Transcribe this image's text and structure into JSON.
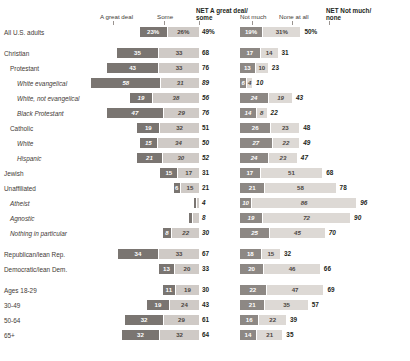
{
  "header": {
    "left": {
      "col1": "A great deal",
      "col2": "Some",
      "net": "NET A great deal/",
      "net2": "some"
    },
    "right": {
      "col1": "Not much",
      "col2": "None at all",
      "net": "NET Not much/",
      "net2": "none"
    }
  },
  "colors": {
    "great_deal": "#7a7571",
    "some": "#cfcac6",
    "not_much": "#8d8884",
    "none_at_all": "#ddd9d5",
    "text": "#231f20"
  },
  "chart_data": {
    "type": "bar",
    "title": "",
    "xlabel": "",
    "ylabel": "",
    "grid": false,
    "legend_position": "top",
    "series": [
      {
        "name": "A great deal"
      },
      {
        "name": "Some"
      },
      {
        "name": "NET A great deal/some"
      },
      {
        "name": "Not much"
      },
      {
        "name": "None at all"
      },
      {
        "name": "NET Not much/none"
      }
    ],
    "categories": [
      "All U.S. adults",
      "Christian",
      "Protestant",
      "White evangelical",
      "White, not evangelical",
      "Black Protestant",
      "Catholic",
      "White",
      "Hispanic",
      "Jewish",
      "Unaffiliated",
      "Atheist",
      "Agnostic",
      "Nothing in particular",
      "Republican/lean Rep.",
      "Democratic/lean Dem.",
      "Ages 18-29",
      "30-49",
      "50-64",
      "65+"
    ],
    "rows": [
      {
        "label": "All U.S. adults",
        "indent": 0,
        "italic": false,
        "gap": false,
        "great_deal": 23,
        "some": 26,
        "net_left": 49,
        "not_much": 19,
        "none": 31,
        "net_right": 50,
        "gd_txt": "23%",
        "some_txt": "26%",
        "netl_txt": "49%",
        "nm_txt": "19%",
        "none_txt": "31%",
        "netr_txt": "50%"
      },
      {
        "label": "Christian",
        "indent": 0,
        "italic": false,
        "gap": true,
        "great_deal": 35,
        "some": 33,
        "net_left": 68,
        "not_much": 17,
        "none": 14,
        "net_right": 31,
        "gd_txt": "35",
        "some_txt": "33",
        "netl_txt": "68",
        "nm_txt": "17",
        "none_txt": "14",
        "netr_txt": "31"
      },
      {
        "label": "Protestant",
        "indent": 1,
        "italic": false,
        "gap": false,
        "great_deal": 43,
        "some": 33,
        "net_left": 76,
        "not_much": 13,
        "none": 10,
        "net_right": 23,
        "gd_txt": "43",
        "some_txt": "33",
        "netl_txt": "76",
        "nm_txt": "13",
        "none_txt": "10",
        "netr_txt": "23"
      },
      {
        "label": "White evangelical",
        "indent": 2,
        "italic": true,
        "gap": false,
        "great_deal": 58,
        "some": 31,
        "net_left": 89,
        "not_much": 6,
        "none": 4,
        "net_right": 10,
        "gd_txt": "58",
        "some_txt": "31",
        "netl_txt": "89",
        "nm_txt": "6",
        "none_txt": "4",
        "netr_txt": "10"
      },
      {
        "label": "White, not evangelical",
        "indent": 2,
        "italic": true,
        "gap": false,
        "great_deal": 19,
        "some": 38,
        "net_left": 56,
        "not_much": 24,
        "none": 19,
        "net_right": 43,
        "gd_txt": "19",
        "some_txt": "38",
        "netl_txt": "56",
        "nm_txt": "24",
        "none_txt": "19",
        "netr_txt": "43"
      },
      {
        "label": "Black Protestant",
        "indent": 2,
        "italic": true,
        "gap": false,
        "great_deal": 47,
        "some": 29,
        "net_left": 76,
        "not_much": 14,
        "none": 8,
        "net_right": 22,
        "gd_txt": "47",
        "some_txt": "29",
        "netl_txt": "76",
        "nm_txt": "14",
        "none_txt": "8",
        "netr_txt": "22"
      },
      {
        "label": "Catholic",
        "indent": 1,
        "italic": false,
        "gap": false,
        "great_deal": 19,
        "some": 32,
        "net_left": 51,
        "not_much": 26,
        "none": 23,
        "net_right": 48,
        "gd_txt": "19",
        "some_txt": "32",
        "netl_txt": "51",
        "nm_txt": "26",
        "none_txt": "23",
        "netr_txt": "48"
      },
      {
        "label": "White",
        "indent": 2,
        "italic": true,
        "gap": false,
        "great_deal": 15,
        "some": 34,
        "net_left": 50,
        "not_much": 27,
        "none": 22,
        "net_right": 49,
        "gd_txt": "15",
        "some_txt": "34",
        "netl_txt": "50",
        "nm_txt": "27",
        "none_txt": "22",
        "netr_txt": "49"
      },
      {
        "label": "Hispanic",
        "indent": 2,
        "italic": true,
        "gap": false,
        "great_deal": 21,
        "some": 30,
        "net_left": 52,
        "not_much": 24,
        "none": 23,
        "net_right": 47,
        "gd_txt": "21",
        "some_txt": "30",
        "netl_txt": "52",
        "nm_txt": "24",
        "none_txt": "23",
        "netr_txt": "47"
      },
      {
        "label": "Jewish",
        "indent": 0,
        "italic": false,
        "gap": false,
        "great_deal": 15,
        "some": 17,
        "net_left": 31,
        "not_much": 17,
        "none": 51,
        "net_right": 68,
        "gd_txt": "15",
        "some_txt": "17",
        "netl_txt": "31",
        "nm_txt": "17",
        "none_txt": "51",
        "netr_txt": "68"
      },
      {
        "label": "Unaffiliated",
        "indent": 0,
        "italic": false,
        "gap": false,
        "great_deal": 6,
        "some": 15,
        "net_left": 21,
        "not_much": 21,
        "none": 58,
        "net_right": 78,
        "gd_txt": "6",
        "some_txt": "15",
        "netl_txt": "21",
        "nm_txt": "21",
        "none_txt": "58",
        "netr_txt": "78"
      },
      {
        "label": "Atheist",
        "indent": 1,
        "italic": true,
        "gap": false,
        "great_deal": 2,
        "some": 2,
        "net_left": 4,
        "not_much": 10,
        "none": 86,
        "net_right": 96,
        "gd_txt": "",
        "some_txt": "",
        "netl_txt": "4",
        "nm_txt": "10",
        "none_txt": "86",
        "netr_txt": "96"
      },
      {
        "label": "Agnostic",
        "indent": 1,
        "italic": true,
        "gap": false,
        "great_deal": 3,
        "some": 5,
        "net_left": 8,
        "not_much": 19,
        "none": 72,
        "net_right": 90,
        "gd_txt": "",
        "some_txt": "",
        "netl_txt": "8",
        "nm_txt": "19",
        "none_txt": "72",
        "netr_txt": "90"
      },
      {
        "label": "Nothing in particular",
        "indent": 1,
        "italic": true,
        "gap": false,
        "great_deal": 8,
        "some": 22,
        "net_left": 30,
        "not_much": 25,
        "none": 45,
        "net_right": 70,
        "gd_txt": "8",
        "some_txt": "22",
        "netl_txt": "30",
        "nm_txt": "25",
        "none_txt": "45",
        "netr_txt": "70"
      },
      {
        "label": "Republican/lean Rep.",
        "indent": 0,
        "italic": false,
        "gap": true,
        "great_deal": 34,
        "some": 33,
        "net_left": 67,
        "not_much": 18,
        "none": 15,
        "net_right": 32,
        "gd_txt": "34",
        "some_txt": "33",
        "netl_txt": "67",
        "nm_txt": "18",
        "none_txt": "15",
        "netr_txt": "32"
      },
      {
        "label": "Democratic/lean Dem.",
        "indent": 0,
        "italic": false,
        "gap": false,
        "great_deal": 13,
        "some": 20,
        "net_left": 33,
        "not_much": 20,
        "none": 46,
        "net_right": 66,
        "gd_txt": "13",
        "some_txt": "20",
        "netl_txt": "33",
        "nm_txt": "20",
        "none_txt": "46",
        "netr_txt": "66"
      },
      {
        "label": "Ages 18-29",
        "indent": 0,
        "italic": false,
        "gap": true,
        "great_deal": 11,
        "some": 19,
        "net_left": 30,
        "not_much": 22,
        "none": 47,
        "net_right": 69,
        "gd_txt": "11",
        "some_txt": "19",
        "netl_txt": "30",
        "nm_txt": "22",
        "none_txt": "47",
        "netr_txt": "69"
      },
      {
        "label": "30-49",
        "indent": 0,
        "italic": false,
        "gap": false,
        "great_deal": 19,
        "some": 24,
        "net_left": 43,
        "not_much": 21,
        "none": 35,
        "net_right": 57,
        "gd_txt": "19",
        "some_txt": "24",
        "netl_txt": "43",
        "nm_txt": "21",
        "none_txt": "35",
        "netr_txt": "57"
      },
      {
        "label": "50-64",
        "indent": 0,
        "italic": false,
        "gap": false,
        "great_deal": 32,
        "some": 29,
        "net_left": 61,
        "not_much": 16,
        "none": 22,
        "net_right": 39,
        "gd_txt": "32",
        "some_txt": "29",
        "netl_txt": "61",
        "nm_txt": "16",
        "none_txt": "22",
        "netr_txt": "39"
      },
      {
        "label": "65+",
        "indent": 0,
        "italic": false,
        "gap": false,
        "great_deal": 32,
        "some": 32,
        "net_left": 64,
        "not_much": 14,
        "none": 21,
        "net_right": 35,
        "gd_txt": "32",
        "some_txt": "32",
        "netl_txt": "64",
        "nm_txt": "14",
        "none_txt": "21",
        "netr_txt": "35"
      }
    ]
  }
}
